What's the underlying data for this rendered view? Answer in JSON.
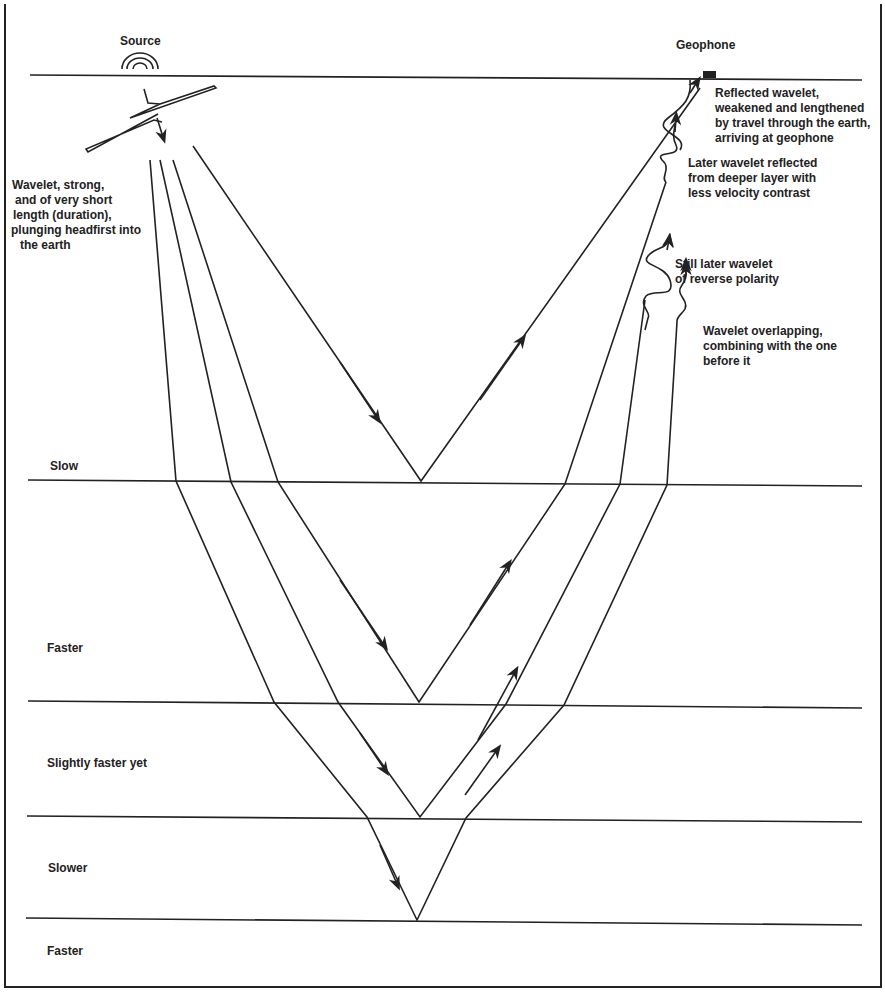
{
  "title_labels": {
    "source": "Source",
    "geophone": "Geophone"
  },
  "annotations": {
    "source_wavelet": [
      "Wavelet, strong,",
      "and of very short",
      "length (duration),",
      "plunging headfirst into",
      "the earth"
    ],
    "reflected_wavelet": [
      "Reflected wavelet,",
      "weakened and lengthened",
      "by travel through the earth,",
      "arriving at geophone"
    ],
    "later_wavelet": [
      "Later wavelet reflected",
      "from deeper layer with",
      "less velocity contrast"
    ],
    "reverse_polarity": [
      "Still later wavelet",
      "of reverse polarity"
    ],
    "overlapping": [
      "Wavelet overlapping,",
      "combining with the one",
      "before it"
    ]
  },
  "layers": [
    {
      "label": "Slow"
    },
    {
      "label": "Faster"
    },
    {
      "label": "Slightly faster yet"
    },
    {
      "label": "Slower"
    },
    {
      "label": "Faster"
    }
  ],
  "colors": {
    "ink": "#222222",
    "background": "#ffffff"
  }
}
